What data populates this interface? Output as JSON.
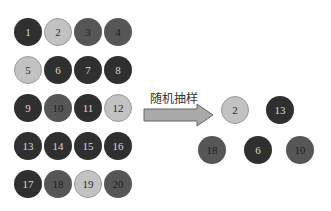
{
  "population": [
    {
      "n": "1",
      "shade": "dark",
      "x": 14,
      "y": 18
    },
    {
      "n": "2",
      "shade": "light",
      "x": 44,
      "y": 18
    },
    {
      "n": "3",
      "shade": "medium",
      "x": 74,
      "y": 18
    },
    {
      "n": "4",
      "shade": "medium",
      "x": 104,
      "y": 18
    },
    {
      "n": "5",
      "shade": "light",
      "x": 14,
      "y": 56
    },
    {
      "n": "6",
      "shade": "dark",
      "x": 44,
      "y": 56
    },
    {
      "n": "7",
      "shade": "dark",
      "x": 74,
      "y": 56
    },
    {
      "n": "8",
      "shade": "dark",
      "x": 104,
      "y": 56
    },
    {
      "n": "9",
      "shade": "dark",
      "x": 14,
      "y": 94
    },
    {
      "n": "10",
      "shade": "medium",
      "x": 44,
      "y": 94
    },
    {
      "n": "11",
      "shade": "dark",
      "x": 74,
      "y": 94
    },
    {
      "n": "12",
      "shade": "light",
      "x": 104,
      "y": 94
    },
    {
      "n": "13",
      "shade": "dark",
      "x": 14,
      "y": 132
    },
    {
      "n": "14",
      "shade": "dark",
      "x": 44,
      "y": 132
    },
    {
      "n": "15",
      "shade": "dark",
      "x": 74,
      "y": 132
    },
    {
      "n": "16",
      "shade": "dark",
      "x": 104,
      "y": 132
    },
    {
      "n": "17",
      "shade": "dark",
      "x": 14,
      "y": 170
    },
    {
      "n": "18",
      "shade": "medium",
      "x": 44,
      "y": 170
    },
    {
      "n": "19",
      "shade": "light",
      "x": 74,
      "y": 170
    },
    {
      "n": "20",
      "shade": "medium",
      "x": 104,
      "y": 170
    }
  ],
  "arrow_label": "随机抽样",
  "sample": [
    {
      "n": "2",
      "shade": "light",
      "x": 221,
      "y": 96
    },
    {
      "n": "13",
      "shade": "dark",
      "x": 266,
      "y": 96
    },
    {
      "n": "18",
      "shade": "medium",
      "x": 198,
      "y": 136
    },
    {
      "n": "6",
      "shade": "dark",
      "x": 244,
      "y": 136
    },
    {
      "n": "10",
      "shade": "medium",
      "x": 286,
      "y": 136
    }
  ]
}
